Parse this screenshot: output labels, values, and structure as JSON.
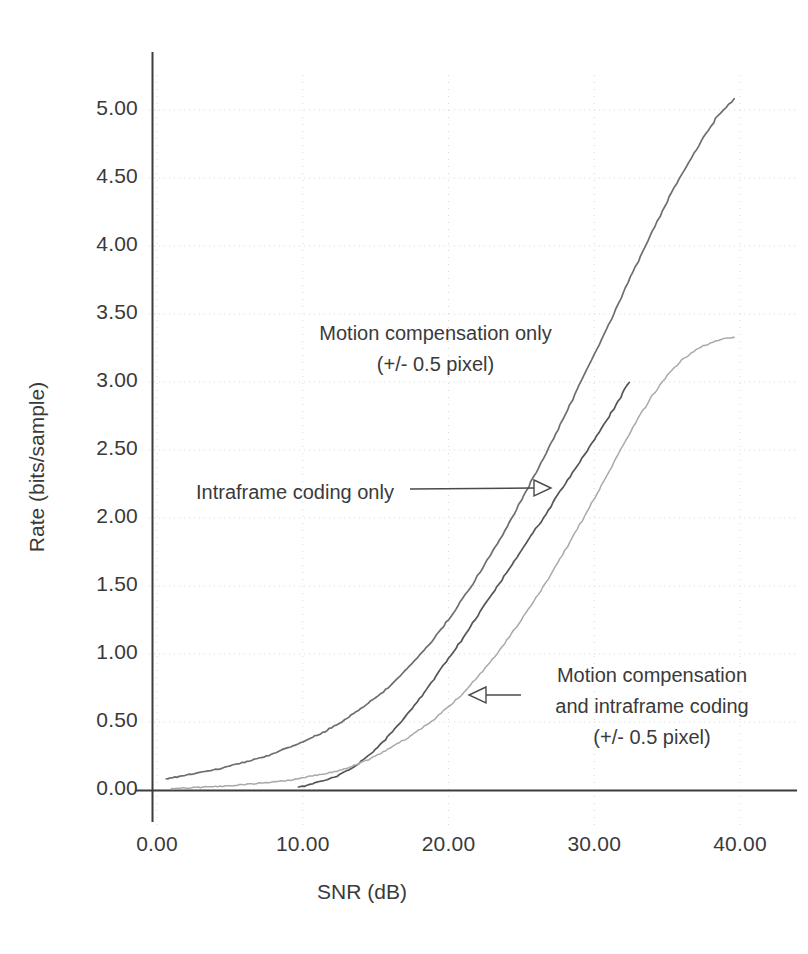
{
  "chart_data": {
    "type": "line",
    "title": "",
    "xlabel": "SNR (dB)",
    "ylabel": "Rate (bits/sample)",
    "xlim": [
      0.0,
      40.0
    ],
    "ylim": [
      0.0,
      5.25
    ],
    "grid": "dotted light gray at major ticks",
    "legend_position": "inline annotations with arrows",
    "xticks": [
      "0.00",
      "10.00",
      "20.00",
      "30.00",
      "40.00"
    ],
    "xtick_values": [
      0,
      10,
      20,
      30,
      40
    ],
    "yticks": [
      "0.00",
      "0.50",
      "1.00",
      "1.50",
      "2.00",
      "2.50",
      "3.00",
      "3.50",
      "4.00",
      "4.50",
      "5.00"
    ],
    "ytick_values": [
      0.0,
      0.5,
      1.0,
      1.5,
      2.0,
      2.5,
      3.0,
      3.5,
      4.0,
      4.5,
      5.0
    ],
    "series": [
      {
        "name": "Motion compensation only (+/- 0.5 pixel)",
        "color": "#6e6e6e",
        "x": [
          0.6,
          1.5,
          2.5,
          3.5,
          4.5,
          5.5,
          6.5,
          7.5,
          8.5,
          9.5,
          10.5,
          11.5,
          12.5,
          13.5,
          14.5,
          15.5,
          16.5,
          17.5,
          18.5,
          19.5,
          20.5,
          21.5,
          22.5,
          23.5,
          24.5,
          25.5,
          26.5,
          27.5,
          28.5,
          29.5,
          30.5,
          31.5,
          32.5,
          33.5,
          34.5,
          35.5,
          36.5,
          37.5,
          38.5,
          39.6
        ],
        "y": [
          0.08,
          0.1,
          0.12,
          0.14,
          0.16,
          0.19,
          0.22,
          0.25,
          0.29,
          0.33,
          0.38,
          0.43,
          0.49,
          0.56,
          0.64,
          0.72,
          0.82,
          0.93,
          1.05,
          1.18,
          1.33,
          1.49,
          1.66,
          1.84,
          2.03,
          2.23,
          2.44,
          2.65,
          2.87,
          3.09,
          3.31,
          3.54,
          3.77,
          4.0,
          4.22,
          4.43,
          4.62,
          4.8,
          4.96,
          5.08
        ]
      },
      {
        "name": "Intraframe coding only",
        "color": "#555555",
        "x": [
          9.7,
          10.5,
          11.5,
          12.5,
          13.5,
          14.5,
          15.5,
          16.5,
          17.5,
          18.5,
          19.5,
          20.5,
          21.5,
          22.5,
          23.5,
          24.5,
          25.5,
          26.5,
          27.5,
          28.5,
          29.5,
          30.5,
          31.5,
          32.4
        ],
        "y": [
          0.02,
          0.04,
          0.07,
          0.11,
          0.17,
          0.25,
          0.35,
          0.47,
          0.6,
          0.74,
          0.89,
          1.04,
          1.2,
          1.36,
          1.52,
          1.68,
          1.84,
          2.0,
          2.17,
          2.33,
          2.49,
          2.66,
          2.83,
          3.0
        ]
      },
      {
        "name": "Motion compensation and intraframe coding (+/- 0.5 pixel)",
        "color": "#a9a9a9",
        "x": [
          1.0,
          2.0,
          3.0,
          4.0,
          5.0,
          6.0,
          7.0,
          8.0,
          9.0,
          10.0,
          11.0,
          12.0,
          13.0,
          14.0,
          15.0,
          16.0,
          17.0,
          18.0,
          19.0,
          20.0,
          21.0,
          22.0,
          23.0,
          24.0,
          25.0,
          26.0,
          27.0,
          28.0,
          29.0,
          30.0,
          31.0,
          32.0,
          33.0,
          34.0,
          35.0,
          36.0,
          37.0,
          38.0,
          39.0,
          39.6
        ],
        "y": [
          0.01,
          0.015,
          0.02,
          0.025,
          0.03,
          0.04,
          0.05,
          0.06,
          0.07,
          0.09,
          0.11,
          0.13,
          0.16,
          0.2,
          0.25,
          0.31,
          0.37,
          0.44,
          0.52,
          0.61,
          0.71,
          0.83,
          0.96,
          1.1,
          1.25,
          1.41,
          1.58,
          1.76,
          1.95,
          2.14,
          2.34,
          2.54,
          2.73,
          2.9,
          3.05,
          3.16,
          3.24,
          3.29,
          3.32,
          3.33
        ]
      }
    ],
    "annotations": [
      {
        "name": "motion-compensation-only",
        "line1": "Motion compensation only",
        "line2": "(+/- 0.5 pixel)"
      },
      {
        "name": "intraframe-coding-only",
        "line1": "Intraframe coding only",
        "line2": ""
      },
      {
        "name": "motion-compensation-and-intraframe",
        "line1": "Motion compensation",
        "line2": "and intraframe coding",
        "line3": "(+/- 0.5 pixel)"
      }
    ]
  },
  "axes": {
    "x_title": "SNR (dB)",
    "y_title": "Rate (bits/sample)",
    "xticks": [
      {
        "label": "0.00"
      },
      {
        "label": "10.00"
      },
      {
        "label": "20.00"
      },
      {
        "label": "30.00"
      },
      {
        "label": "40.00"
      }
    ],
    "yticks": [
      {
        "label": "5.00"
      },
      {
        "label": "4.50"
      },
      {
        "label": "4.00"
      },
      {
        "label": "3.50"
      },
      {
        "label": "3.00"
      },
      {
        "label": "2.50"
      },
      {
        "label": "2.00"
      },
      {
        "label": "1.50"
      },
      {
        "label": "1.00"
      },
      {
        "label": "0.50"
      },
      {
        "label": "0.00"
      }
    ]
  },
  "annotations": {
    "mc_only_line1": "Motion compensation only",
    "mc_only_line2": "(+/- 0.5 pixel)",
    "intra_only": "Intraframe coding only",
    "mc_intra_line1": "Motion compensation",
    "mc_intra_line2": "and intraframe coding",
    "mc_intra_line3": "(+/- 0.5 pixel)"
  },
  "colors": {
    "axis": "#3d3d3d",
    "grid": "#d8d8d8",
    "series1": "#6e6e6e",
    "series2": "#555555",
    "series3": "#a9a9a9",
    "text": "#3a3a3a"
  }
}
